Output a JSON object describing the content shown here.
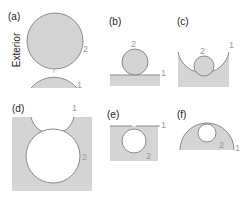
{
  "figure": {
    "panels": [
      {
        "id": "a",
        "label": "(a)",
        "labels": {
          "surface1": "1",
          "surface2": "2"
        }
      },
      {
        "id": "b",
        "label": "(b)",
        "labels": {
          "surface1": "1",
          "surface2": "2"
        }
      },
      {
        "id": "c",
        "label": "(c)",
        "labels": {
          "surface1": "1",
          "surface2": "2"
        }
      },
      {
        "id": "d",
        "label": "(d)",
        "labels": {
          "surface1": "1",
          "surface2": "2"
        }
      },
      {
        "id": "e",
        "label": "(e)",
        "labels": {
          "surface1": "1",
          "surface2": "2"
        }
      },
      {
        "id": "f",
        "label": "(f)",
        "labels": {
          "surface1": "1",
          "surface2": "2"
        }
      }
    ],
    "row_labels": {
      "top": "Exterior",
      "bottom": "Interior"
    },
    "colors": {
      "fill": "#d4d4d4",
      "stroke": "#8a8a8a",
      "label": "#999999",
      "text": "#222222"
    }
  }
}
